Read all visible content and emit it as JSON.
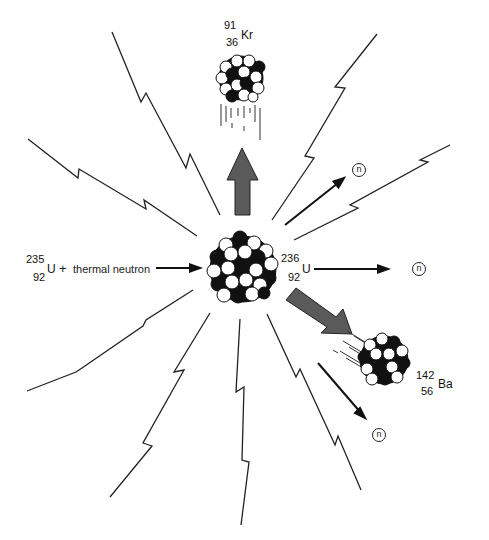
{
  "diagram": {
    "reactant": {
      "mass_number": "235",
      "atomic_number": "92",
      "symbol": "U",
      "plus": "+",
      "projectile": "thermal neutron"
    },
    "compound_nucleus": {
      "mass_number": "236",
      "atomic_number": "92",
      "symbol": "U"
    },
    "fragments": [
      {
        "mass_number": "91",
        "atomic_number": "36",
        "symbol": "Kr"
      },
      {
        "mass_number": "142",
        "atomic_number": "56",
        "symbol": "Ba"
      }
    ],
    "neutrons": [
      {
        "label": "n"
      },
      {
        "label": "n"
      },
      {
        "label": "n"
      }
    ],
    "colors": {
      "line": "#222222",
      "arrow_fill": "#5a5a5a",
      "nucleon_dark": "#111111",
      "nucleon_light": "#ffffff"
    }
  }
}
